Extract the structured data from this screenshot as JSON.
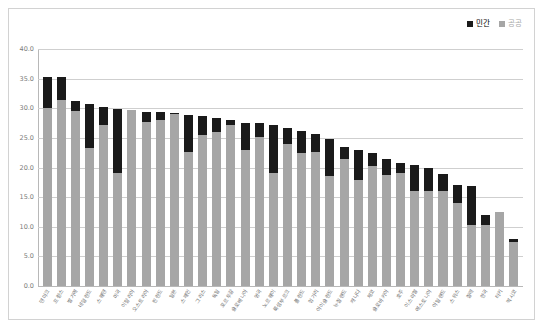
{
  "legend": {
    "position": "top-right",
    "entries": [
      {
        "label": "민간",
        "color": "#1a1a1a",
        "name": "private"
      },
      {
        "label": "공공",
        "color": "#a6a6a6",
        "name": "public"
      }
    ]
  },
  "axis": {
    "y_ticks": [
      "0.0",
      "5.0",
      "10.0",
      "15.0",
      "20.0",
      "25.0",
      "30.0",
      "35.0",
      "40.0"
    ]
  },
  "chart_data": {
    "type": "bar",
    "subtype": "stacked-bar",
    "title": "",
    "subtitle": "",
    "xlabel": "",
    "ylabel": "",
    "ylim": [
      0,
      40
    ],
    "ytick_step": 5,
    "grid": true,
    "legend_position": "top-right",
    "categories": [
      "덴마크",
      "프랑스",
      "벨기에",
      "네덜란드",
      "스웨덴",
      "미국",
      "이탈리아",
      "오스트리아",
      "핀란드",
      "일본",
      "스페인",
      "그리스",
      "독일",
      "포르투갈",
      "슬로베니아",
      "영국",
      "노르웨이",
      "룩셈부르크",
      "폴란드",
      "헝가리",
      "아이슬란드",
      "뉴질랜드",
      "캐나다",
      "체코",
      "슬로바키아",
      "호주",
      "이스라엘",
      "에스토니아",
      "아일랜드",
      "스위스",
      "칠레",
      "한국",
      "터키",
      "멕시코"
    ],
    "series": [
      {
        "name": "공공",
        "color": "#a6a6a6",
        "values": [
          30.0,
          31.4,
          29.5,
          23.3,
          27.2,
          19.1,
          29.7,
          27.7,
          28.0,
          29.0,
          22.7,
          25.5,
          26.0,
          27.1,
          23.0,
          25.1,
          19.0,
          24.0,
          22.5,
          22.7,
          18.5,
          21.5,
          17.9,
          20.3,
          18.8,
          19.0,
          16.0,
          16.0,
          16.0,
          14.0,
          10.3,
          10.3,
          12.5,
          7.5
        ]
      },
      {
        "name": "민간",
        "color": "#1a1a1a",
        "values": [
          5.2,
          3.8,
          1.8,
          7.4,
          3.0,
          10.7,
          0.0,
          1.6,
          1.3,
          0.2,
          6.1,
          3.2,
          2.4,
          0.9,
          4.5,
          2.4,
          8.2,
          2.6,
          3.6,
          2.9,
          6.3,
          2.0,
          5.1,
          2.2,
          2.6,
          1.7,
          4.5,
          4.0,
          2.9,
          3.0,
          6.5,
          1.7,
          0.0,
          0.4
        ]
      }
    ],
    "totals": [
      35.2,
      35.2,
      31.3,
      30.7,
      30.2,
      29.8,
      29.7,
      29.3,
      29.3,
      29.2,
      28.8,
      28.7,
      28.4,
      28.0,
      27.5,
      27.5,
      27.2,
      26.6,
      26.1,
      25.6,
      24.8,
      23.5,
      23.0,
      22.5,
      21.4,
      20.7,
      20.5,
      20.0,
      18.9,
      17.0,
      16.8,
      12.0,
      12.5,
      7.9
    ]
  }
}
